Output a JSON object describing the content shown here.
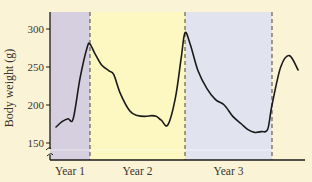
{
  "colors": {
    "background": "#fbf3d6",
    "year1_shade": "#d5cfdf",
    "year2_shade": "#fdf8c2",
    "year3_shade": "#e1e4ef",
    "line": "#1a1a1a",
    "axis": "#1a1a1a",
    "divider": "#444444"
  },
  "chart_data": {
    "type": "line",
    "title": "",
    "xlabel": "",
    "ylabel": "Body weight (g)",
    "ylim": [
      135,
      320
    ],
    "yticks": [
      150,
      200,
      250,
      300
    ],
    "y_axis_break": true,
    "grid": false,
    "legend": null,
    "regions": [
      {
        "label": "Year 1",
        "x_start": 0.0,
        "x_end": 1.0,
        "shade": "year1_shade"
      },
      {
        "label": "Year 2",
        "x_start": 1.0,
        "x_end": 2.0,
        "shade": "year2_shade"
      },
      {
        "label": "Year 3",
        "x_start": 2.0,
        "x_end": 3.0,
        "shade": "year3_shade"
      }
    ],
    "xtick_labels": [
      "Year 1",
      "Year 2",
      "Year 3"
    ],
    "series": [
      {
        "name": "Body weight",
        "x": [
          0.15,
          0.3,
          0.45,
          0.58,
          0.75,
          0.93,
          1.0,
          1.05,
          1.12,
          1.2,
          1.25,
          1.32,
          1.42,
          1.5,
          1.58,
          1.65,
          1.7,
          1.75,
          1.82,
          1.9,
          1.96,
          2.0,
          2.06,
          2.15,
          2.25,
          2.35,
          2.45,
          2.55,
          2.65,
          2.72,
          2.8,
          2.88,
          2.95,
          3.0,
          3.1,
          3.2,
          3.3
        ],
        "values": [
          171,
          178,
          182,
          182,
          235,
          276,
          280,
          268,
          253,
          245,
          240,
          215,
          192,
          186,
          185,
          186,
          185,
          180,
          174,
          210,
          262,
          295,
          280,
          245,
          222,
          207,
          200,
          185,
          175,
          168,
          164,
          165,
          168,
          200,
          250,
          265,
          246
        ]
      }
    ]
  }
}
